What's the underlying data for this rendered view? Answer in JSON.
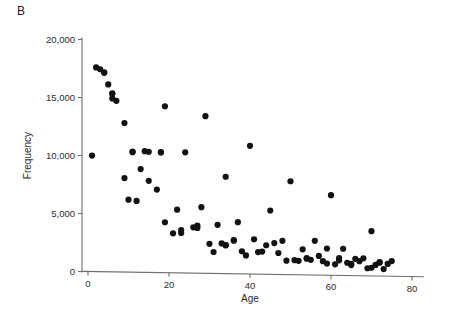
{
  "panel": {
    "label": "B"
  },
  "chart_data": {
    "type": "scatter",
    "title": "",
    "subtitle": "",
    "panel_label": "B",
    "xlabel": "Age",
    "ylabel": "Frequency",
    "xlim": [
      0,
      80
    ],
    "ylim": [
      0,
      20000
    ],
    "xticks": [
      0,
      20,
      40,
      60,
      80
    ],
    "xtick_labels": [
      "0",
      "20",
      "40",
      "60",
      "80"
    ],
    "yticks": [
      0,
      5000,
      10000,
      15000,
      20000
    ],
    "ytick_labels": [
      "0",
      "5,000",
      "10,000",
      "15,000",
      "20,000"
    ],
    "grid": false,
    "legend": null,
    "marker": "filled-circle",
    "marker_color": "#121212",
    "marker_size_px": 5,
    "series": [
      {
        "name": "Frequency by age",
        "points": [
          [
            1,
            10000
          ],
          [
            2,
            17600
          ],
          [
            3,
            17450
          ],
          [
            4,
            17200
          ],
          [
            4,
            17150
          ],
          [
            5,
            16150
          ],
          [
            6,
            15400
          ],
          [
            6,
            15350
          ],
          [
            6,
            14950
          ],
          [
            7,
            14750
          ],
          [
            9,
            12850
          ],
          [
            9,
            8100
          ],
          [
            10,
            6250
          ],
          [
            11,
            10400
          ],
          [
            11,
            10350
          ],
          [
            12,
            6150
          ],
          [
            13,
            8900
          ],
          [
            14,
            10450
          ],
          [
            15,
            10400
          ],
          [
            15,
            7900
          ],
          [
            17,
            7150
          ],
          [
            18,
            10400
          ],
          [
            18,
            10350
          ],
          [
            19,
            14350
          ],
          [
            19,
            4350
          ],
          [
            21,
            3400
          ],
          [
            22,
            5450
          ],
          [
            23,
            3700
          ],
          [
            23,
            3450
          ],
          [
            24,
            10400
          ],
          [
            26,
            3950
          ],
          [
            27,
            4100
          ],
          [
            27,
            3900
          ],
          [
            28,
            5700
          ],
          [
            29,
            13550
          ],
          [
            30,
            2550
          ],
          [
            31,
            1850
          ],
          [
            32,
            4200
          ],
          [
            33,
            2600
          ],
          [
            34,
            2450
          ],
          [
            34,
            8350
          ],
          [
            34,
            2450
          ],
          [
            36,
            2850
          ],
          [
            36,
            2900
          ],
          [
            37,
            4450
          ],
          [
            38,
            1950
          ],
          [
            39,
            1600
          ],
          [
            40,
            11050
          ],
          [
            41,
            3000
          ],
          [
            42,
            1900
          ],
          [
            43,
            1950
          ],
          [
            44,
            2500
          ],
          [
            45,
            5500
          ],
          [
            46,
            2700
          ],
          [
            47,
            1850
          ],
          [
            48,
            2900
          ],
          [
            49,
            1200
          ],
          [
            50,
            8050
          ],
          [
            51,
            1250
          ],
          [
            52,
            1200
          ],
          [
            53,
            2200
          ],
          [
            54,
            1400
          ],
          [
            54,
            1450
          ],
          [
            55,
            1300
          ],
          [
            56,
            2950
          ],
          [
            57,
            1650
          ],
          [
            58,
            1200
          ],
          [
            59,
            2300
          ],
          [
            59,
            1000
          ],
          [
            60,
            6900
          ],
          [
            61,
            950
          ],
          [
            62,
            1500
          ],
          [
            62,
            1300
          ],
          [
            63,
            2300
          ],
          [
            64,
            1100
          ],
          [
            65,
            900
          ],
          [
            65,
            1000
          ],
          [
            66,
            1450
          ],
          [
            67,
            1250
          ],
          [
            68,
            1500
          ],
          [
            69,
            650
          ],
          [
            70,
            3850
          ],
          [
            70,
            700
          ],
          [
            71,
            950
          ],
          [
            72,
            1150
          ],
          [
            72,
            1200
          ],
          [
            73,
            600
          ],
          [
            74,
            1050
          ],
          [
            75,
            1300
          ]
        ]
      }
    ]
  }
}
